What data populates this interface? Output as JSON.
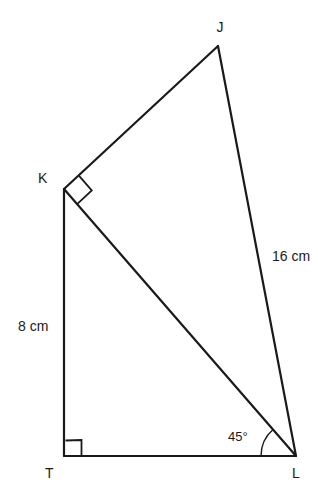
{
  "figure": {
    "type": "geometry-diagram",
    "shape": "quadrilateral-with-diagonal",
    "background_color": "#ffffff",
    "stroke_color": "#1a1a1a",
    "vertices": [
      {
        "name": "J",
        "label": "J",
        "x": 218,
        "y": 46,
        "label_x": 220,
        "label_y": 32
      },
      {
        "name": "K",
        "label": "K",
        "x": 64,
        "y": 189,
        "label_x": 38,
        "label_y": 183
      },
      {
        "name": "T",
        "label": "T",
        "x": 64,
        "y": 456,
        "label_x": 45,
        "label_y": 478
      },
      {
        "name": "L",
        "label": "L",
        "x": 296,
        "y": 456,
        "label_x": 292,
        "label_y": 478
      }
    ],
    "edges": [
      {
        "name": "edge-JK",
        "from": "J",
        "to": "K"
      },
      {
        "name": "edge-JL",
        "from": "J",
        "to": "L"
      },
      {
        "name": "edge-KT",
        "from": "K",
        "to": "T"
      },
      {
        "name": "edge-TL",
        "from": "T",
        "to": "L"
      },
      {
        "name": "diagonal-KL",
        "from": "K",
        "to": "L"
      }
    ],
    "length_labels": [
      {
        "name": "length-JL",
        "text": "16 cm",
        "edge": "JL",
        "x": 272,
        "y": 261
      },
      {
        "name": "length-KT",
        "text": "8 cm",
        "edge": "KT",
        "x": 18,
        "y": 331
      }
    ],
    "angle_labels": [
      {
        "name": "angle-L",
        "text": "45°",
        "vertex": "L",
        "x": 228,
        "y": 441
      }
    ],
    "right_angle_markers": [
      {
        "name": "right-angle-K",
        "vertex": "K",
        "between": [
          "KJ",
          "KL"
        ]
      },
      {
        "name": "right-angle-T",
        "vertex": "T",
        "between": [
          "TK",
          "TL"
        ]
      }
    ]
  }
}
